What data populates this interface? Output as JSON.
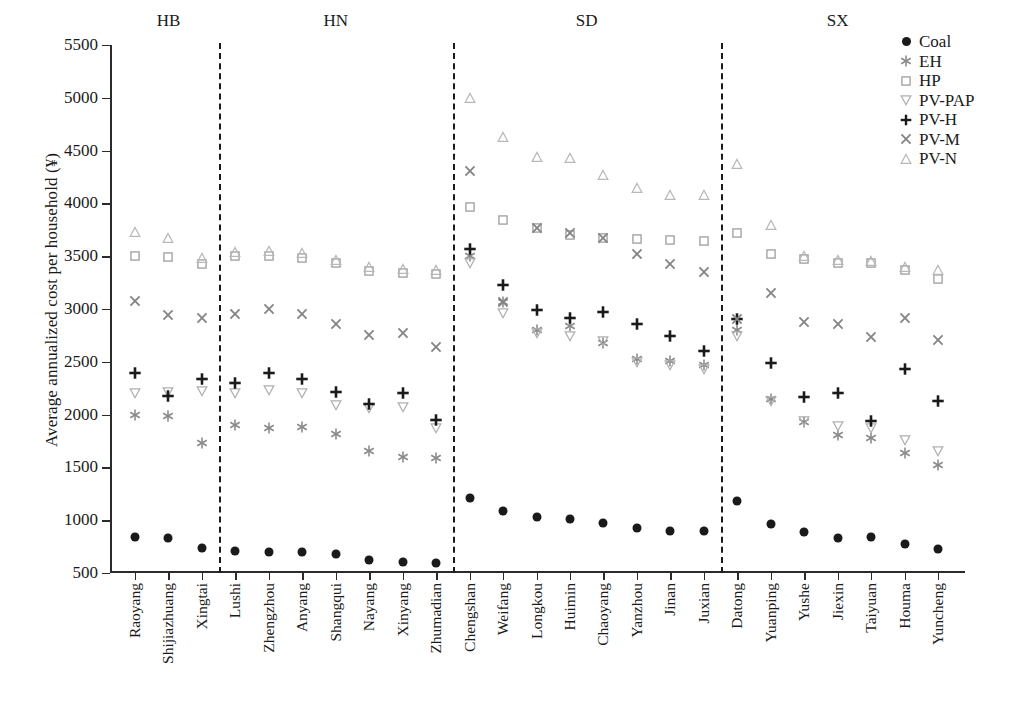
{
  "chart_data": {
    "type": "scatter",
    "title": "",
    "xlabel": "",
    "ylabel": "Average annualized cost per household (¥)",
    "ylim": [
      500,
      5500
    ],
    "ytick_labels": [
      "5500",
      "5000",
      "4500",
      "4000",
      "3500",
      "3000",
      "2500",
      "2000",
      "1500",
      "1000",
      "500"
    ],
    "yticks": [
      5500,
      5000,
      4500,
      4000,
      3500,
      3000,
      2500,
      2000,
      1500,
      1000,
      500
    ],
    "grid": false,
    "legend_position": "top-right",
    "categories": [
      "Raoyang",
      "Shijiazhuang",
      "Xingtai",
      "Lushi",
      "Zhengzhou",
      "Anyang",
      "Shangqui",
      "Nayang",
      "Xinyang",
      "Zhumadian",
      "Chengshan",
      "Weifang",
      "Longkou",
      "Huimin",
      "Chaoyang",
      "Yanzhou",
      "Jinan",
      "Juxian",
      "Datong",
      "Yuanping",
      "Yushe",
      "Jiexin",
      "Taiyuan",
      "Houma",
      "Yuncheng"
    ],
    "groups": [
      {
        "label": "HB",
        "start": 0,
        "end": 2
      },
      {
        "label": "HN",
        "start": 3,
        "end": 9
      },
      {
        "label": "SD",
        "start": 10,
        "end": 17
      },
      {
        "label": "SX",
        "start": 18,
        "end": 24
      }
    ],
    "series": [
      {
        "name": "Coal",
        "marker": "circle-filled",
        "color": "#1a1a1a",
        "values": [
          840,
          830,
          735,
          705,
          700,
          700,
          680,
          620,
          605,
          595,
          1210,
          1090,
          1035,
          1015,
          975,
          925,
          895,
          895,
          1185,
          960,
          885,
          830,
          840,
          775,
          725
        ]
      },
      {
        "name": "EH",
        "marker": "asterisk",
        "color": "#8a8a8a",
        "values": [
          2000,
          1985,
          1735,
          1905,
          1875,
          1880,
          1820,
          1655,
          1600,
          1585,
          3500,
          3065,
          2800,
          2835,
          2680,
          2530,
          2505,
          2470,
          2800,
          2150,
          1930,
          1810,
          1775,
          1640,
          1525
        ]
      },
      {
        "name": "HP",
        "marker": "square",
        "color": "#9a9a9a",
        "values": [
          3500,
          3490,
          3425,
          3505,
          3505,
          3485,
          3440,
          3360,
          3345,
          3330,
          3970,
          3840,
          3770,
          3705,
          3670,
          3660,
          3650,
          3640,
          3715,
          3520,
          3470,
          3440,
          3440,
          3370,
          3285
        ]
      },
      {
        "name": "PV-PAP",
        "marker": "triangle-down",
        "color": "#b0b0b0",
        "values": [
          2200,
          2210,
          2220,
          2205,
          2230,
          2205,
          2090,
          2060,
          2070,
          1875,
          3440,
          2965,
          2775,
          2745,
          2700,
          2495,
          2470,
          2430,
          2745,
          2130,
          1935,
          1890,
          1870,
          1755,
          1655
        ]
      },
      {
        "name": "PV-H",
        "marker": "plus",
        "color": "#1a1a1a",
        "values": [
          2395,
          2175,
          2340,
          2300,
          2395,
          2340,
          2210,
          2100,
          2200,
          1945,
          3570,
          3230,
          2995,
          2915,
          2970,
          2860,
          2745,
          2605,
          2910,
          2490,
          2165,
          2200,
          1940,
          2435,
          2130
        ]
      },
      {
        "name": "PV-M",
        "marker": "cross",
        "color": "#858585",
        "values": [
          3075,
          2945,
          2915,
          2950,
          3000,
          2955,
          2855,
          2750,
          2770,
          2640,
          4310,
          3070,
          3765,
          3720,
          3675,
          3520,
          3430,
          3350,
          2910,
          3155,
          2875,
          2855,
          2735,
          2915,
          2705
        ]
      },
      {
        "name": "PV-N",
        "marker": "triangle-up",
        "color": "#b8b8b8",
        "values": [
          3725,
          3670,
          3480,
          3540,
          3545,
          3530,
          3465,
          3395,
          3380,
          3370,
          5000,
          4625,
          4435,
          4430,
          4270,
          4150,
          4080,
          4075,
          4370,
          3800,
          3500,
          3460,
          3455,
          3400,
          3370
        ]
      }
    ]
  },
  "legend": {
    "items": [
      {
        "label": "Coal"
      },
      {
        "label": "EH"
      },
      {
        "label": "HP"
      },
      {
        "label": "PV-PAP"
      },
      {
        "label": "PV-H"
      },
      {
        "label": "PV-M"
      },
      {
        "label": "PV-N"
      }
    ]
  },
  "caption": {
    "text": ""
  }
}
